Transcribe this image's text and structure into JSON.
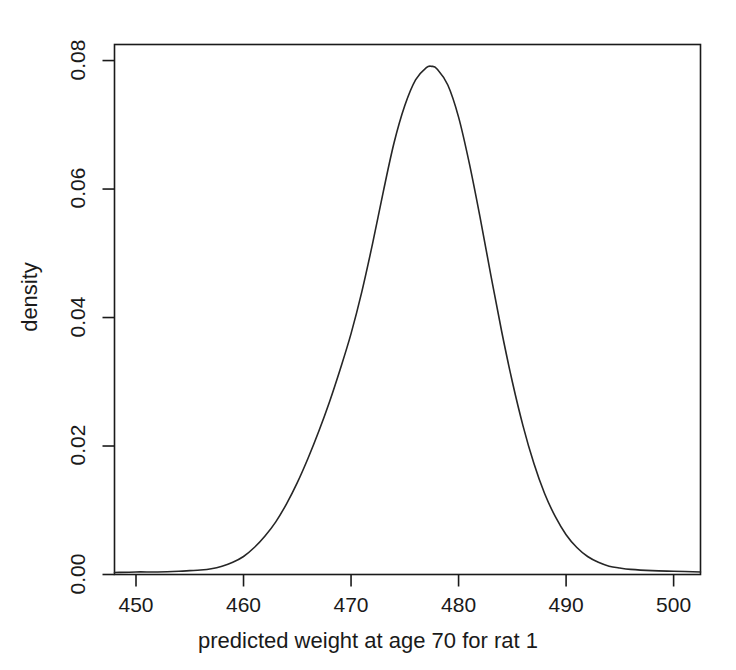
{
  "chart_data": {
    "type": "line",
    "title": "",
    "subtitle": "",
    "xlabel": "predicted weight at age 70 for rat 1",
    "ylabel": "density",
    "xlim": [
      448.0,
      502.5
    ],
    "ylim": [
      0.0,
      0.0825
    ],
    "grid": false,
    "legend": null,
    "xticks": [
      450,
      460,
      470,
      480,
      490,
      500
    ],
    "xtick_labels": [
      "450",
      "460",
      "470",
      "480",
      "490",
      "500"
    ],
    "yticks": [
      0.0,
      0.02,
      0.04,
      0.06,
      0.08
    ],
    "ytick_labels": [
      "0.00",
      "0.02",
      "0.04",
      "0.06",
      "0.08"
    ],
    "series": [
      {
        "name": "density",
        "color": "#262626",
        "linewidth": 1.6,
        "x": [
          448.0,
          450.0,
          452.0,
          454.0,
          455.0,
          456.0,
          457.0,
          458.0,
          459.0,
          460.0,
          461.0,
          462.0,
          463.0,
          464.0,
          465.0,
          466.0,
          467.0,
          468.0,
          469.0,
          470.0,
          471.0,
          472.0,
          473.0,
          474.0,
          475.0,
          476.0,
          477.0,
          477.5,
          478.0,
          479.0,
          480.0,
          481.0,
          482.0,
          483.0,
          484.0,
          485.0,
          486.0,
          487.0,
          488.0,
          489.0,
          490.0,
          491.0,
          492.0,
          493.0,
          494.0,
          495.0,
          496.0,
          498.0,
          500.0,
          502.5
        ],
        "y": [
          0.0003,
          0.0004,
          0.0004,
          0.0005,
          0.0006,
          0.0007,
          0.0009,
          0.0013,
          0.0019,
          0.0028,
          0.0042,
          0.006,
          0.0082,
          0.011,
          0.0143,
          0.0181,
          0.0223,
          0.0269,
          0.032,
          0.0375,
          0.044,
          0.0515,
          0.0596,
          0.0672,
          0.073,
          0.077,
          0.0789,
          0.0791,
          0.0787,
          0.0762,
          0.0712,
          0.064,
          0.0556,
          0.0466,
          0.0379,
          0.03,
          0.0231,
          0.0173,
          0.0126,
          0.009,
          0.0062,
          0.0042,
          0.0028,
          0.0019,
          0.0013,
          0.001,
          0.0008,
          0.0006,
          0.0005,
          0.0004
        ]
      }
    ],
    "peak": {
      "x": 477.5,
      "y": 0.0791
    }
  },
  "axes": {
    "x_label": "predicted weight at age 70 for rat 1",
    "y_label": "density",
    "x_tick_labels": [
      "450",
      "460",
      "470",
      "480",
      "490",
      "500"
    ],
    "y_tick_labels": [
      "0.00",
      "0.02",
      "0.04",
      "0.06",
      "0.08"
    ]
  },
  "style": {
    "background": "#ffffff",
    "frame_color": "#1a1a1a",
    "curve_color": "#262626"
  }
}
